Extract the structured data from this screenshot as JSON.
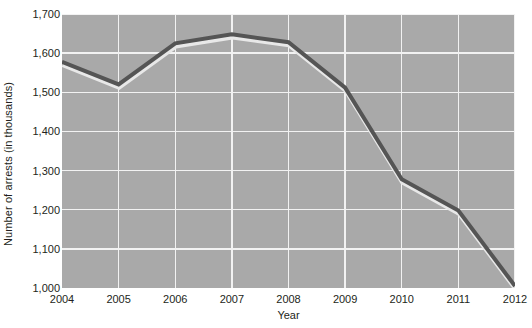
{
  "chart_data": {
    "type": "line",
    "title": "",
    "xlabel": "Year",
    "ylabel": "Number of arrests (in thousands)",
    "categories": [
      "2004",
      "2005",
      "2006",
      "2007",
      "2008",
      "2009",
      "2010",
      "2011",
      "2012"
    ],
    "x": [
      2004,
      2005,
      2006,
      2007,
      2008,
      2009,
      2010,
      2011,
      2012
    ],
    "values": [
      1578,
      1520,
      1625,
      1648,
      1628,
      1512,
      1278,
      1198,
      1005
    ],
    "series": [
      {
        "name": "Number of arrests",
        "values": [
          1578,
          1520,
          1625,
          1648,
          1628,
          1512,
          1278,
          1198,
          1005
        ]
      }
    ],
    "ylim": [
      1000,
      1700
    ],
    "xlim": [
      2004,
      2012
    ],
    "y_ticks": [
      1000,
      1100,
      1200,
      1300,
      1400,
      1500,
      1600,
      1700
    ],
    "y_tick_labels": [
      "1,000",
      "1,100",
      "1,200",
      "1,300",
      "1,400",
      "1,500",
      "1,600",
      "1,700"
    ],
    "x_ticks": [
      2004,
      2005,
      2006,
      2007,
      2008,
      2009,
      2010,
      2011,
      2012
    ],
    "x_tick_labels": [
      "2004",
      "2005",
      "2006",
      "2007",
      "2008",
      "2009",
      "2010",
      "2011",
      "2012"
    ],
    "grid": true,
    "grid_horizontal": true,
    "grid_vertical": true,
    "legend": false,
    "legend_position": "none",
    "colors": {
      "plot_background": "#a9a9a9",
      "page_background": "#ffffff",
      "gridline": "#f2f2f2",
      "line": "#555555",
      "line_shadow": "#e8e8e8",
      "text": "#231f20"
    },
    "line_width": 4,
    "annotations": []
  }
}
